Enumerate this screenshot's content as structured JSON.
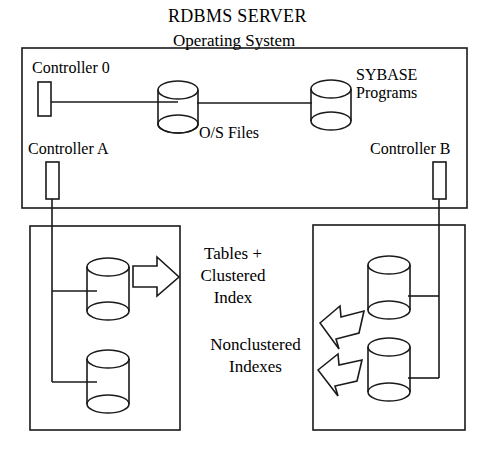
{
  "diagram": {
    "title": "RDBMS SERVER",
    "server_box": {
      "label": "Operating System",
      "controllers": [
        {
          "name": "controller-0",
          "label": "Controller 0"
        },
        {
          "name": "controller-a",
          "label": "Controller A"
        },
        {
          "name": "controller-b",
          "label": "Controller B"
        }
      ],
      "cylinders": [
        {
          "name": "os-files-cylinder",
          "label": "O/S Files"
        },
        {
          "name": "sybase-programs-cylinder",
          "label": "SYBASE\nPrograms"
        }
      ]
    },
    "left_disk_box": {
      "name": "left-disk-array",
      "annotation": "Tables +\nClustered\nIndex",
      "arrow": "right-block-arrow",
      "disks": [
        {
          "name": "left-disk-1"
        },
        {
          "name": "left-disk-2"
        }
      ]
    },
    "right_disk_box": {
      "name": "right-disk-array",
      "annotation": "Nonclustered\nIndexes",
      "arrows": [
        {
          "name": "left-block-arrow-upper"
        },
        {
          "name": "left-block-arrow-lower"
        }
      ],
      "disks": [
        {
          "name": "right-disk-1"
        },
        {
          "name": "right-disk-2"
        }
      ]
    },
    "colors": {
      "stroke": "#1a1a1a",
      "background": "#ffffff",
      "text": "#000000"
    }
  }
}
